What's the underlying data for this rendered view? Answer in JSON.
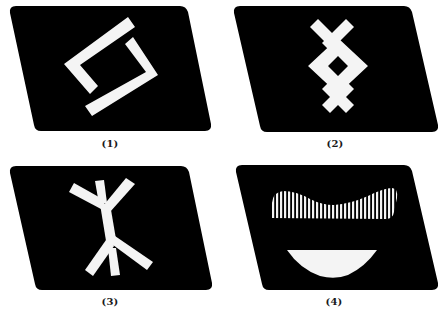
{
  "figure": {
    "background": "#ffffff",
    "card_color": "#000000",
    "symbol_color": "#f4f4f4",
    "panels": [
      {
        "id": 1,
        "label": "(1)",
        "symbol": "interlocking-hooks",
        "label_pos": [
          110,
          140
        ]
      },
      {
        "id": 2,
        "label": "(2)",
        "symbol": "cross-diamond-cross",
        "label_pos": [
          335,
          140
        ]
      },
      {
        "id": 3,
        "label": "(3)",
        "symbol": "forked-stem",
        "label_pos": [
          110,
          297
        ]
      },
      {
        "id": 4,
        "label": "(4)",
        "symbol": "striped-wave-and-lens",
        "label_pos": [
          334,
          297
        ]
      }
    ]
  }
}
